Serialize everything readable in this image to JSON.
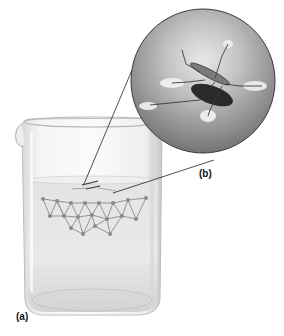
{
  "figure": {
    "labels": {
      "a": "(a)",
      "b": "(b)"
    },
    "panels": [
      {
        "id": "a",
        "subject": "beaker-of-water-with-water-strider",
        "description": "Glass beaker containing water; a network of hydrogen-bonded water molecules drawn just below the surface"
      },
      {
        "id": "b",
        "subject": "magnified-water-strider",
        "description": "Circular close-up of a water strider standing on the water surface, legs dimpling the surface"
      }
    ],
    "colors": {
      "background": "#ffffff",
      "molecule": "#8a8a8a",
      "glass_edge": "#b8b8b8",
      "inset_dark": "#5a5a5a",
      "inset_light": "#e6e6e6",
      "leader_line": "#222222"
    }
  }
}
